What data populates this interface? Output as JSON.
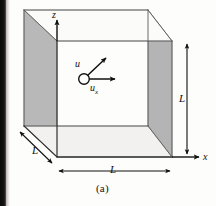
{
  "figure": {
    "caption": "(a)",
    "axes": {
      "z_label": "z",
      "x_label": "x"
    },
    "vectors": {
      "u_label": "u",
      "ux_label": "u",
      "ux_subscript": "x"
    },
    "dimensions": {
      "right_height_label": "L",
      "bottom_width_label": "L",
      "depth_label": "L"
    },
    "colors": {
      "face_shading": "#b8b8b8",
      "face_shading_dark": "#a9a9a9",
      "outline": "#4a4a4a",
      "ink": "#101010",
      "page_background": "#fdfdfb",
      "scan_edge": "#0d0b0a"
    }
  }
}
